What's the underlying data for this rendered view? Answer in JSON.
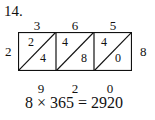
{
  "problem_number": "14.",
  "multiplicand_digits": [
    "3",
    "6",
    "5"
  ],
  "multiplier": "2",
  "right_label": "8",
  "cells": [
    {
      "top": "2",
      "bottom": "4"
    },
    {
      "top": "4",
      "bottom": "8"
    },
    {
      "top": "4",
      "bottom": "0"
    }
  ],
  "result_digits": [
    "9",
    "2",
    "0"
  ],
  "equation": "8 × 365 = 2920"
}
